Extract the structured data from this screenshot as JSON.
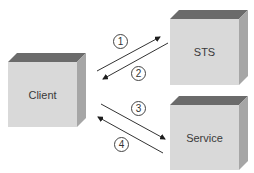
{
  "diagram": {
    "nodes": [
      {
        "id": "client",
        "label": "Client"
      },
      {
        "id": "sts",
        "label": "STS"
      },
      {
        "id": "service",
        "label": "Service"
      }
    ],
    "edges": [
      {
        "step": "1",
        "from": "client",
        "to": "sts"
      },
      {
        "step": "2",
        "from": "sts",
        "to": "client"
      },
      {
        "step": "3",
        "from": "client",
        "to": "service"
      },
      {
        "step": "4",
        "from": "service",
        "to": "client"
      }
    ],
    "colors": {
      "box_front": "#d8d8d8",
      "box_top": "#6e6e6e",
      "box_side": "#a8a8a8",
      "arrow": "#2a2a2a"
    }
  }
}
